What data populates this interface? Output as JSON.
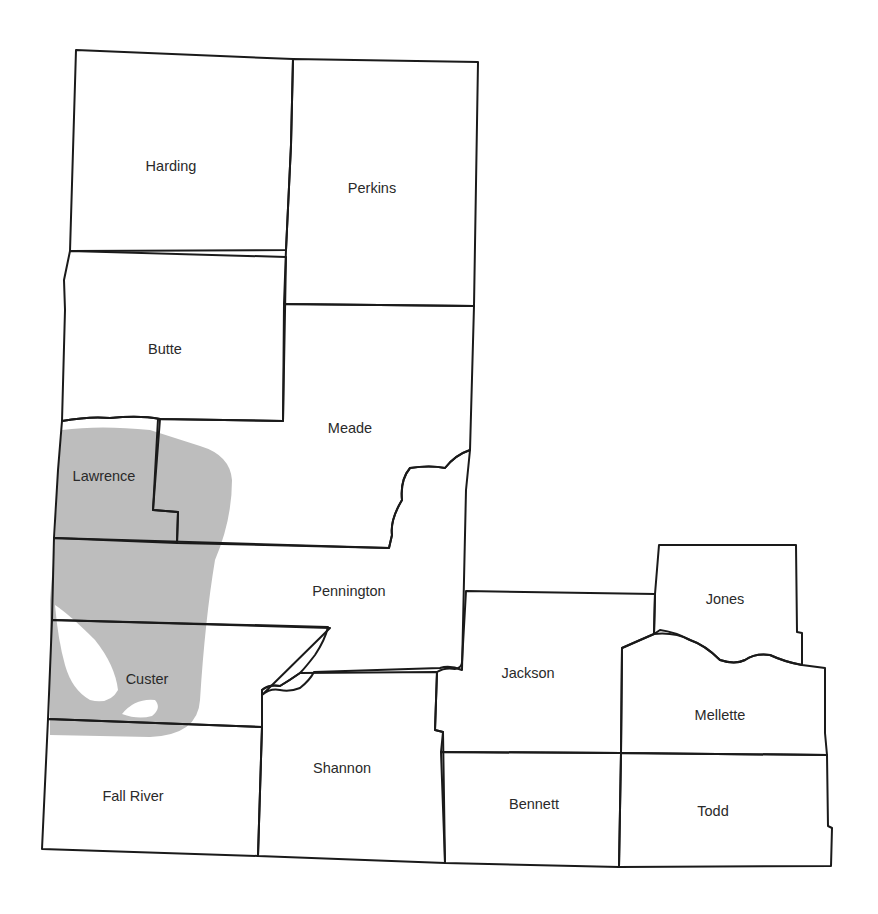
{
  "map": {
    "shaded_region": {
      "name": "Black Hills",
      "color": "#bdbdbd"
    },
    "counties": [
      {
        "id": "harding",
        "label": "Harding",
        "x": 171,
        "y": 166
      },
      {
        "id": "perkins",
        "label": "Perkins",
        "x": 372,
        "y": 188
      },
      {
        "id": "butte",
        "label": "Butte",
        "x": 165,
        "y": 349
      },
      {
        "id": "meade",
        "label": "Meade",
        "x": 350,
        "y": 428
      },
      {
        "id": "lawrence",
        "label": "Lawrence",
        "x": 104,
        "y": 476
      },
      {
        "id": "pennington",
        "label": "Pennington",
        "x": 349,
        "y": 591
      },
      {
        "id": "custer",
        "label": "Custer",
        "x": 147,
        "y": 679
      },
      {
        "id": "fall-river",
        "label": "Fall River",
        "x": 133,
        "y": 796
      },
      {
        "id": "shannon",
        "label": "Shannon",
        "x": 342,
        "y": 768
      },
      {
        "id": "jackson",
        "label": "Jackson",
        "x": 528,
        "y": 673
      },
      {
        "id": "jones",
        "label": "Jones",
        "x": 725,
        "y": 599
      },
      {
        "id": "mellette",
        "label": "Mellette",
        "x": 720,
        "y": 715
      },
      {
        "id": "bennett",
        "label": "Bennett",
        "x": 534,
        "y": 804
      },
      {
        "id": "todd",
        "label": "Todd",
        "x": 713,
        "y": 811
      }
    ]
  }
}
